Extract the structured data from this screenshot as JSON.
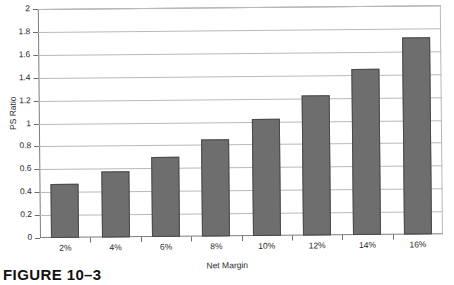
{
  "caption": "FIGURE 10–3",
  "chart_data": {
    "type": "bar",
    "title": "",
    "xlabel": "Net Margin",
    "ylabel": "PS Ratio",
    "categories": [
      "2%",
      "4%",
      "6%",
      "8%",
      "10%",
      "12%",
      "14%",
      "16%"
    ],
    "values": [
      0.47,
      0.58,
      0.7,
      0.85,
      1.02,
      1.22,
      1.45,
      1.72
    ],
    "ylim": [
      0,
      2
    ],
    "ytick_labels": [
      "0",
      "0.2",
      "0.4",
      "0.6",
      "0.8",
      "1",
      "1.2",
      "1.4",
      "1.6",
      "1.8",
      "2"
    ],
    "ytick_values": [
      0,
      0.2,
      0.4,
      0.6,
      0.8,
      1,
      1.2,
      1.4,
      1.6,
      1.8,
      2
    ],
    "grid": true,
    "legend": "none",
    "bar_color": "#6e6e6e",
    "bar_border_color": "#4a4a4a",
    "gridline_color": "#b9b9b9",
    "axis_color": "#7d7d7d",
    "background": "#ffffff"
  }
}
